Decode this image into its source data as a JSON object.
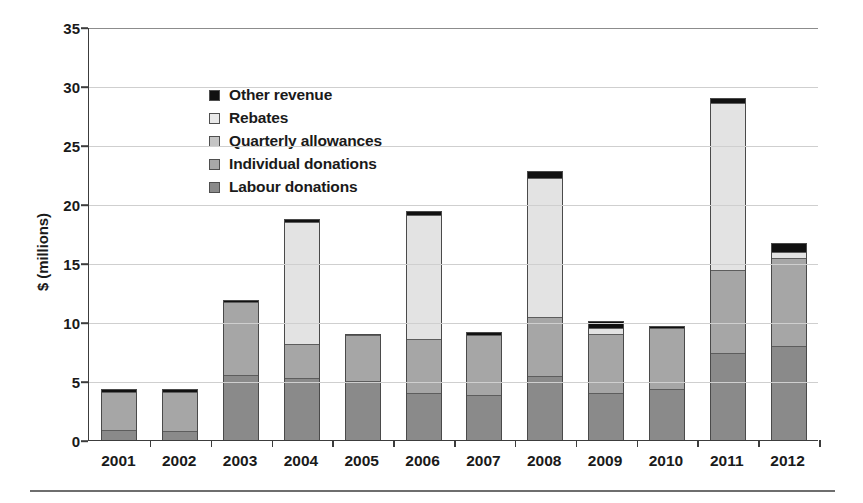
{
  "chart_data": {
    "type": "bar",
    "subtype": "stacked-bar",
    "title": "",
    "xlabel": "",
    "ylabel": "$ (millions)",
    "ylim": [
      0,
      35
    ],
    "yticks": [
      0,
      5,
      10,
      15,
      20,
      25,
      30,
      35
    ],
    "grid": true,
    "legend_position": "upper left",
    "categories": [
      "2001",
      "2002",
      "2003",
      "2004",
      "2005",
      "2006",
      "2007",
      "2008",
      "2009",
      "2010",
      "2011",
      "2012"
    ],
    "series": [
      {
        "name": "Labour donations",
        "color": "#8a8a8a",
        "values": [
          0.8,
          0.7,
          5.5,
          5.2,
          5.0,
          3.9,
          3.8,
          5.4,
          3.9,
          4.3,
          7.3,
          7.9
        ]
      },
      {
        "name": "Individual donations",
        "color": "#a6a6a6",
        "values": [
          3.3,
          3.4,
          6.2,
          2.9,
          3.9,
          4.6,
          5.1,
          5.0,
          5.1,
          5.2,
          7.1,
          7.5
        ]
      },
      {
        "name": "Quarterly allowances",
        "color": "#bfbfbf",
        "values": [
          0.0,
          0.0,
          0.0,
          0.0,
          0.0,
          0.0,
          0.0,
          0.0,
          0.0,
          0.0,
          0.0,
          0.0
        ]
      },
      {
        "name": "Rebates",
        "color": "#e3e3e3",
        "values": [
          0.0,
          0.0,
          0.0,
          10.4,
          0.0,
          10.6,
          0.0,
          11.8,
          0.5,
          0.0,
          14.2,
          0.5
        ]
      },
      {
        "name": "Other revenue",
        "color": "#111111",
        "values": [
          0.2,
          0.2,
          0.15,
          0.2,
          0.1,
          0.3,
          0.25,
          0.6,
          0.6,
          0.2,
          0.4,
          0.8
        ]
      }
    ],
    "totals": [
      4.3,
      4.3,
      11.85,
      18.7,
      9.0,
      19.4,
      9.15,
      22.8,
      10.1,
      9.7,
      29.0,
      16.7
    ]
  },
  "legend": {
    "items": [
      {
        "label": "Other revenue",
        "color": "#111111"
      },
      {
        "label": "Rebates",
        "color": "#e9e9e9"
      },
      {
        "label": "Quarterly allowances",
        "color": "#c4c4c4"
      },
      {
        "label": "Individual donations",
        "color": "#a8a8a8"
      },
      {
        "label": "Labour donations",
        "color": "#8a8a8a"
      }
    ]
  },
  "axis": {
    "y_title": "$ (millions)",
    "y_tick_labels": [
      "35",
      "30",
      "25",
      "20",
      "15",
      "10",
      "5",
      "0"
    ],
    "x_tick_labels": [
      "2001",
      "2002",
      "2003",
      "2004",
      "2005",
      "2006",
      "2007",
      "2008",
      "2009",
      "2010",
      "2011",
      "2012"
    ]
  }
}
